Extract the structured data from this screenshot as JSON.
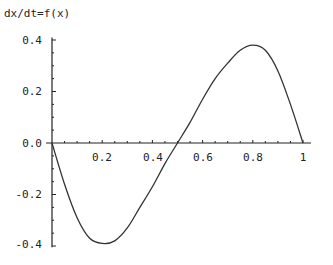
{
  "chart_data": {
    "type": "line",
    "title": "dx/dt=f(x)",
    "xlabel": "",
    "ylabel": "dx/dt=f(x)",
    "xlim": [
      0,
      1.03
    ],
    "ylim": [
      -0.4,
      0.4
    ],
    "grid": false,
    "legend": null,
    "x_ticks": [
      0.2,
      0.4,
      0.6,
      0.8,
      1
    ],
    "x_tick_labels": [
      "0.2",
      "0.4",
      "0.6",
      "0.8",
      "1"
    ],
    "y_ticks": [
      0.4,
      0.2,
      0.0,
      -0.2,
      -0.4
    ],
    "y_tick_labels": [
      "0.4",
      "0.2",
      "0.0",
      "-0.2",
      "-0.4"
    ],
    "series": [
      {
        "name": "f(x)",
        "x": [
          0.0,
          0.05,
          0.1,
          0.15,
          0.2,
          0.25,
          0.3,
          0.35,
          0.4,
          0.45,
          0.5,
          0.55,
          0.6,
          0.65,
          0.7,
          0.75,
          0.8,
          0.85,
          0.9,
          0.95,
          1.0
        ],
        "y": [
          0.0,
          -0.16,
          -0.29,
          -0.37,
          -0.39,
          -0.38,
          -0.33,
          -0.25,
          -0.17,
          -0.08,
          0.0,
          0.08,
          0.17,
          0.25,
          0.31,
          0.36,
          0.38,
          0.36,
          0.28,
          0.15,
          0.0
        ]
      }
    ]
  },
  "labels": {
    "title": "dx/dt=f(x)",
    "y": [
      "0.4",
      "0.2",
      "0.0",
      "-0.2",
      "-0.4"
    ],
    "x": [
      "0.2",
      "0.4",
      "0.6",
      "0.8",
      "1"
    ]
  }
}
